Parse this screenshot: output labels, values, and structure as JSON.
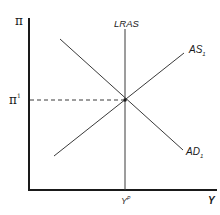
{
  "diagram": {
    "type": "economics-ad-as",
    "y_axis": {
      "label": "π"
    },
    "x_axis": {
      "label": "Y"
    },
    "inflation_level": {
      "label": "π",
      "superscript": "1"
    },
    "potential_output": {
      "label": "Y",
      "superscript": "P"
    },
    "curves": {
      "lras": {
        "label": "LRAS"
      },
      "as": {
        "label": "AS",
        "subscript": "1"
      },
      "ad": {
        "label": "AD",
        "subscript": "1"
      }
    },
    "colors": {
      "axis": "#1a1a1a",
      "curve": "#3a3a3a",
      "guide": "#3a3a3a",
      "background": "#ffffff"
    }
  }
}
